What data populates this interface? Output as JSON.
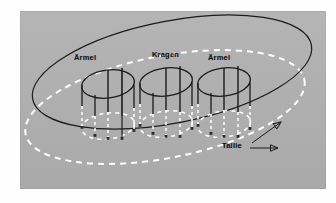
{
  "figure": {
    "type": "technical-diagram",
    "background_color": "#fdfdfd",
    "panel_color": "#b0b0b0",
    "solid_line_color": "#1b1b1b",
    "dashed_line_color": "#ffffff"
  },
  "labels": {
    "sleeve_left": "Ärmel",
    "collar": "Kragen",
    "sleeve_right": "Ärmel",
    "waist": "Tallie"
  },
  "annotations": {
    "waist_arrow_upper_target": "solid outer ellipse",
    "waist_arrow_lower_target": "dashed outer ellipse"
  },
  "shapes": {
    "outer_cylinder": {
      "top_ellipse": {
        "cx": 172,
        "cy": 73,
        "rx": 143,
        "ry": 52,
        "rotation": -11,
        "style": "solid",
        "color": "#1b1b1b"
      },
      "bottom_ellipse": {
        "cx": 165,
        "cy": 107,
        "rx": 143,
        "ry": 52,
        "rotation": -11,
        "style": "dashed",
        "color": "#ffffff"
      }
    },
    "inner_cylinders": [
      {
        "label": "Ärmel",
        "cx": 108,
        "top_cy": 84,
        "bottom_cy": 126,
        "rx": 26,
        "ry": 13
      },
      {
        "label": "Kragen",
        "cx": 166,
        "top_cy": 82,
        "bottom_cy": 124,
        "rx": 26,
        "ry": 13
      },
      {
        "label": "Ärmel",
        "cx": 224,
        "top_cy": 82,
        "bottom_cy": 124,
        "rx": 26,
        "ry": 13
      }
    ]
  }
}
